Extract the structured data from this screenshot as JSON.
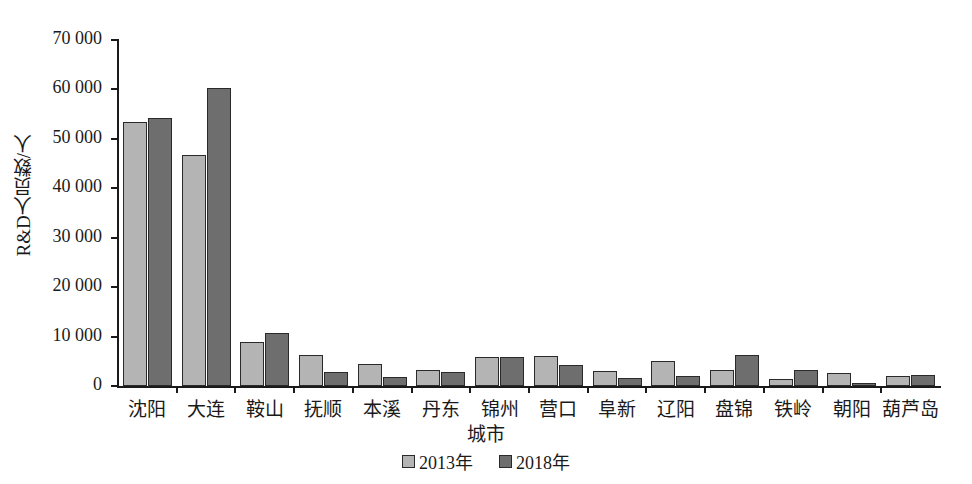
{
  "chart_data": {
    "type": "bar",
    "title": "",
    "xlabel": "城市",
    "ylabel": "R&D人员数/人",
    "ylim": [
      0,
      70000
    ],
    "yticks": [
      0,
      10000,
      20000,
      30000,
      40000,
      50000,
      60000,
      70000
    ],
    "ytick_labels": [
      "0",
      "10 000",
      "20 000",
      "30 000",
      "40 000",
      "50 000",
      "60 000",
      "70 000"
    ],
    "grid": false,
    "legend_position": "bottom-center",
    "categories": [
      "沈阳",
      "大连",
      "鞍山",
      "抚顺",
      "本溪",
      "丹东",
      "锦州",
      "营口",
      "阜新",
      "辽阳",
      "盘锦",
      "铁岭",
      "朝阳",
      "葫芦岛"
    ],
    "series": [
      {
        "name": "2013年",
        "color": "#b4b4b4",
        "values": [
          53400,
          46800,
          9000,
          6300,
          4500,
          3300,
          5900,
          6100,
          3100,
          5000,
          3200,
          1500,
          2600,
          2000
        ]
      },
      {
        "name": "2018年",
        "color": "#6e6e6e",
        "values": [
          54200,
          60300,
          10800,
          2800,
          1900,
          2900,
          5900,
          4200,
          1600,
          2000,
          6300,
          3300,
          700,
          2200
        ]
      }
    ]
  },
  "legend": {
    "items": [
      {
        "label": "2013年"
      },
      {
        "label": "2018年"
      }
    ]
  },
  "colors": {
    "series_2013": "#b4b4b4",
    "series_2018": "#6e6e6e",
    "axis": "#1a1a1a",
    "background": "#ffffff"
  }
}
